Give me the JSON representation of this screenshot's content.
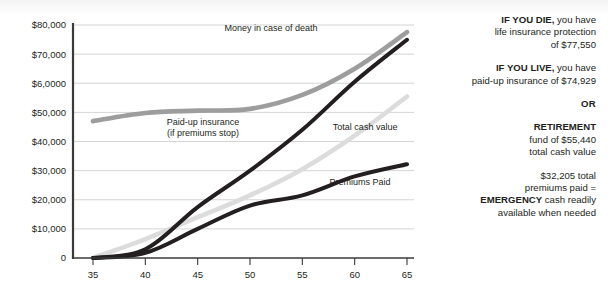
{
  "chart_data": {
    "type": "line",
    "title": "",
    "xlabel": "",
    "ylabel": "",
    "x": [
      35,
      40,
      45,
      50,
      55,
      60,
      65
    ],
    "xlim": [
      35,
      65
    ],
    "ylim": [
      0,
      80000
    ],
    "grid": true,
    "legend_position": "inline-annotations",
    "ytick_labels": [
      "$80,000",
      "$70,000",
      "$6,0000",
      "$50,000",
      "$40,000",
      "$30,000",
      "$20,000",
      "$10,000",
      "0"
    ],
    "ytick_values": [
      80000,
      70000,
      60000,
      50000,
      40000,
      30000,
      20000,
      10000,
      0
    ],
    "xtick_labels": [
      "35",
      "40",
      "45",
      "50",
      "55",
      "60",
      "65"
    ],
    "series": [
      {
        "name": "Money in case of death",
        "color": "#9d9d9d",
        "values": [
          47000,
          49800,
          50600,
          51200,
          56000,
          65000,
          77550
        ]
      },
      {
        "name": "Paid-up insurance (if premiums stop)",
        "color": "#231f20",
        "values": [
          0,
          3000,
          17500,
          30000,
          44000,
          60500,
          74929
        ]
      },
      {
        "name": "Total cash value",
        "color": "#dcdcdc",
        "values": [
          0,
          6500,
          14000,
          21500,
          30500,
          42000,
          55440
        ]
      },
      {
        "name": "Premiums Paid",
        "color": "#231f20",
        "values": [
          0,
          1800,
          10000,
          18000,
          21500,
          28000,
          32205
        ]
      }
    ],
    "annotations": [
      {
        "text": "Money in case of death",
        "x": 52,
        "y": 78000
      },
      {
        "text": "Paid-up insurance",
        "x": 45.5,
        "y": 45500
      },
      {
        "text": "(if premiums stop)",
        "x": 45.5,
        "y": 41800
      },
      {
        "text": "Total cash value",
        "x": 61,
        "y": 44000
      },
      {
        "text": "Premiums Paid",
        "x": 60.5,
        "y": 25000
      }
    ]
  },
  "sidebar": {
    "blocks": [
      {
        "id": "if-you-die",
        "lead": "IF YOU DIE,",
        "rest": " you have",
        "line2": "life insurance protection",
        "line3": "of $77,550"
      },
      {
        "id": "if-you-live",
        "lead": "IF YOU LIVE,",
        "rest": " you have",
        "line2": "paid-up insurance of $74,929",
        "line3": ""
      }
    ],
    "or_label": "OR",
    "retirement": {
      "heading": "RETIREMENT",
      "line2": "fund of $55,440",
      "line3": "total cash value"
    },
    "emergency": {
      "line1": "$32,205 total",
      "line2": "premiums paid =",
      "lead": "EMERGENCY",
      "rest": " cash readily",
      "line4": "available when needed"
    }
  },
  "colors": {
    "ink": "#231f20",
    "axis": "#3a3a3a",
    "grid": "#cfcfcf",
    "death_line": "#9d9d9d",
    "paidup_line": "#231f20",
    "cash_line": "#dcdcdc",
    "premium_line": "#231f20"
  }
}
